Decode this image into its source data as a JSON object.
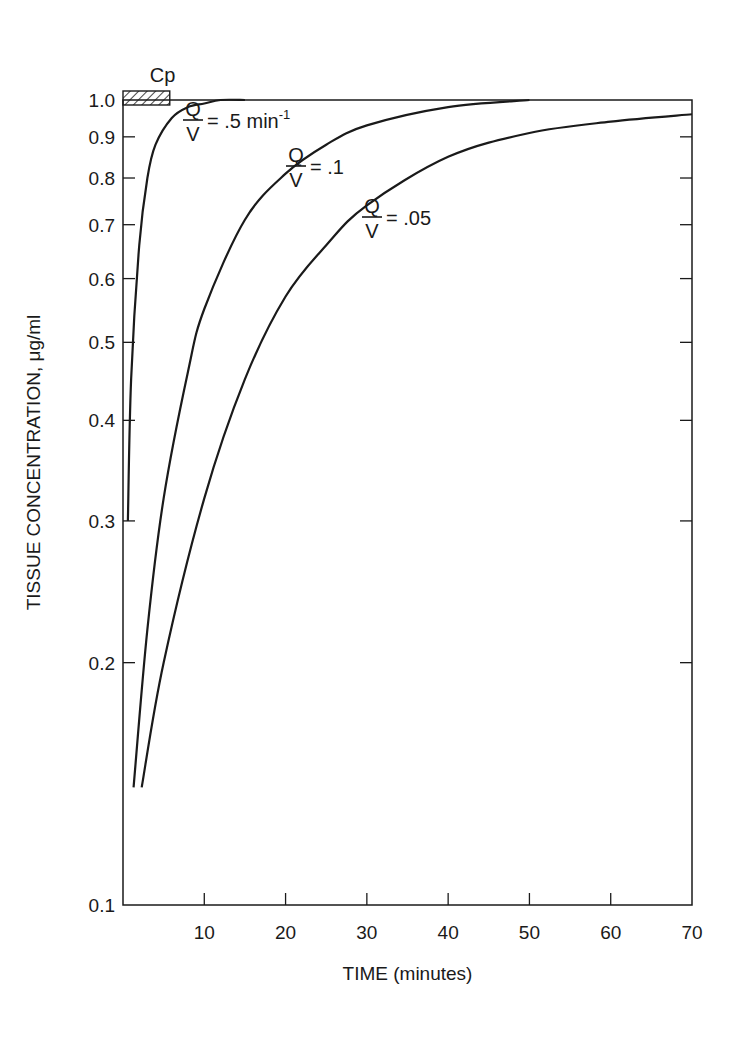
{
  "chart_data": {
    "type": "line",
    "title": "",
    "xlabel": "TIME (minutes)",
    "ylabel": "TISSUE CONCENTRATION, μg/ml",
    "xlim": [
      0,
      70
    ],
    "ylim": [
      0.1,
      1.0
    ],
    "yscale": "log",
    "grid": false,
    "x_ticks": [
      "10",
      "20",
      "30",
      "40",
      "50",
      "60",
      "70"
    ],
    "y_ticks": [
      "0.1",
      "0.2",
      "0.3",
      "0.4",
      "0.5",
      "0.6",
      "0.7",
      "0.8",
      "0.9",
      "1.0"
    ],
    "reference": {
      "label": "Cp",
      "value": 1.0,
      "x_range": [
        0,
        6
      ]
    },
    "series": [
      {
        "name": "Q/V = .5 min-1",
        "label_num": "Q",
        "label_den": "V",
        "label_val": "= .5 min",
        "label_sup": "-1",
        "x": [
          0.6,
          1,
          2,
          3,
          4,
          6,
          8,
          10,
          12,
          15
        ],
        "y": [
          0.3,
          0.45,
          0.66,
          0.8,
          0.88,
          0.95,
          0.98,
          0.99,
          1.0,
          1.0
        ]
      },
      {
        "name": "Q/V = .1",
        "label_num": "Q",
        "label_den": "V",
        "label_val": "= .1",
        "x": [
          1.3,
          3,
          5,
          8,
          10,
          15,
          20,
          25,
          30,
          40,
          50
        ],
        "y": [
          0.14,
          0.22,
          0.32,
          0.46,
          0.55,
          0.71,
          0.81,
          0.88,
          0.93,
          0.98,
          1.0
        ]
      },
      {
        "name": "Q/V = .05",
        "label_num": "Q",
        "label_den": "V",
        "label_val": "= .05",
        "x": [
          2.3,
          5,
          10,
          15,
          20,
          25,
          30,
          40,
          50,
          60,
          70
        ],
        "y": [
          0.14,
          0.2,
          0.32,
          0.45,
          0.57,
          0.66,
          0.74,
          0.85,
          0.91,
          0.94,
          0.96
        ]
      }
    ]
  }
}
